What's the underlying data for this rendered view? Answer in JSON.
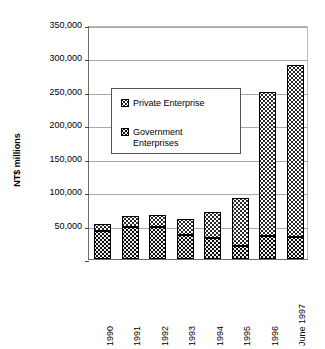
{
  "chart_data": {
    "type": "bar",
    "subtype": "stacked",
    "title": "",
    "xlabel": "",
    "ylabel": "NT$ millions",
    "ylim": [
      0,
      350000
    ],
    "ytick_values": [
      0,
      50000,
      100000,
      150000,
      200000,
      250000,
      300000,
      350000
    ],
    "ytick_labels": [
      "",
      "50,000",
      "100,000",
      "150,000",
      "200,000",
      "250,000",
      "300,000",
      "350,000"
    ],
    "grid": true,
    "legend_position": "upper-left-inside",
    "categories": [
      "1990",
      "1991",
      "1992",
      "1993",
      "1994",
      "1995",
      "1996",
      "June 1997"
    ],
    "series": [
      {
        "name": "Government Enterprises",
        "fill": "dark-speckle",
        "values": [
          42000,
          48000,
          48000,
          36000,
          32000,
          20000,
          35000,
          33000
        ]
      },
      {
        "name": "Private Enterprise",
        "fill": "light-dotted",
        "values": [
          10000,
          17000,
          18000,
          24000,
          38000,
          72000,
          215000,
          257000
        ]
      }
    ],
    "totals": [
      52000,
      65000,
      66000,
      60000,
      70000,
      92000,
      250000,
      290000
    ],
    "colors": {
      "axis": "#6e6e6e",
      "gridline": "#a8a8a8",
      "private_fill": "#ffffff",
      "government_fill": "#0d0d0d",
      "outline": "#000000",
      "text": "#000000"
    }
  },
  "legend": {
    "entries": [
      {
        "label": "Private Enterprise",
        "swatch": "private-swatch"
      },
      {
        "label": "Government\nEnterprises",
        "swatch": "government-swatch"
      }
    ]
  },
  "axes": {
    "y_title": "NT$ millions"
  }
}
